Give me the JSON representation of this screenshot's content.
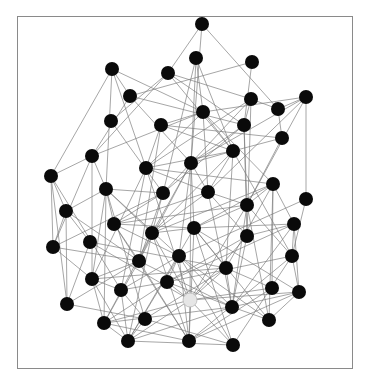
{
  "diagram": {
    "type": "network-graph",
    "frame": {
      "x": 17,
      "y": 16,
      "width": 336,
      "height": 353,
      "border_color": "#8a8a8a"
    },
    "colors": {
      "node": "#0a0a0a",
      "highlight_node": "#e6e6e6",
      "edge": "#7a7a7a",
      "background": "#ffffff"
    },
    "node_radius": 7,
    "nodes": [
      {
        "id": 0,
        "x": 202,
        "y": 24
      },
      {
        "id": 1,
        "x": 112,
        "y": 69
      },
      {
        "id": 2,
        "x": 168,
        "y": 73
      },
      {
        "id": 3,
        "x": 196,
        "y": 58
      },
      {
        "id": 4,
        "x": 252,
        "y": 62
      },
      {
        "id": 5,
        "x": 130,
        "y": 96
      },
      {
        "id": 6,
        "x": 251,
        "y": 99
      },
      {
        "id": 7,
        "x": 278,
        "y": 109
      },
      {
        "id": 8,
        "x": 306,
        "y": 97
      },
      {
        "id": 9,
        "x": 111,
        "y": 121
      },
      {
        "id": 10,
        "x": 161,
        "y": 125
      },
      {
        "id": 11,
        "x": 203,
        "y": 112
      },
      {
        "id": 12,
        "x": 244,
        "y": 125
      },
      {
        "id": 13,
        "x": 282,
        "y": 138
      },
      {
        "id": 14,
        "x": 92,
        "y": 156
      },
      {
        "id": 15,
        "x": 51,
        "y": 176
      },
      {
        "id": 16,
        "x": 146,
        "y": 168
      },
      {
        "id": 17,
        "x": 191,
        "y": 163
      },
      {
        "id": 18,
        "x": 233,
        "y": 151
      },
      {
        "id": 19,
        "x": 106,
        "y": 189
      },
      {
        "id": 20,
        "x": 163,
        "y": 193
      },
      {
        "id": 21,
        "x": 208,
        "y": 192
      },
      {
        "id": 22,
        "x": 273,
        "y": 184
      },
      {
        "id": 23,
        "x": 306,
        "y": 199
      },
      {
        "id": 24,
        "x": 66,
        "y": 211
      },
      {
        "id": 25,
        "x": 247,
        "y": 205
      },
      {
        "id": 26,
        "x": 114,
        "y": 224
      },
      {
        "id": 27,
        "x": 152,
        "y": 233
      },
      {
        "id": 28,
        "x": 194,
        "y": 228
      },
      {
        "id": 29,
        "x": 294,
        "y": 224
      },
      {
        "id": 30,
        "x": 53,
        "y": 247
      },
      {
        "id": 31,
        "x": 90,
        "y": 242
      },
      {
        "id": 32,
        "x": 247,
        "y": 236
      },
      {
        "id": 33,
        "x": 139,
        "y": 261
      },
      {
        "id": 34,
        "x": 179,
        "y": 256
      },
      {
        "id": 35,
        "x": 226,
        "y": 268
      },
      {
        "id": 36,
        "x": 292,
        "y": 256
      },
      {
        "id": 37,
        "x": 92,
        "y": 279
      },
      {
        "id": 38,
        "x": 167,
        "y": 282
      },
      {
        "id": 39,
        "x": 272,
        "y": 288
      },
      {
        "id": 40,
        "x": 121,
        "y": 290
      },
      {
        "id": 41,
        "x": 299,
        "y": 292
      },
      {
        "id": 42,
        "x": 67,
        "y": 304
      },
      {
        "id": 43,
        "x": 104,
        "y": 323
      },
      {
        "id": 44,
        "x": 145,
        "y": 319
      },
      {
        "id": 45,
        "x": 232,
        "y": 307
      },
      {
        "id": 46,
        "x": 269,
        "y": 320
      },
      {
        "id": 47,
        "x": 128,
        "y": 341
      },
      {
        "id": 48,
        "x": 189,
        "y": 341
      },
      {
        "id": 49,
        "x": 233,
        "y": 345
      },
      {
        "id": 50,
        "x": 190,
        "y": 300,
        "highlight": true
      }
    ],
    "edge_density": "dense",
    "max_edge_length": 140,
    "edge_keep_ratio": 0.42
  }
}
